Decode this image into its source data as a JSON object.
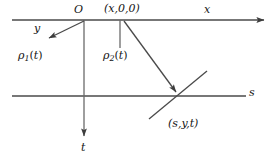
{
  "figure": {
    "type": "geometry-diagram",
    "background_color": "#ffffff",
    "stroke_color": "#4a4a4a",
    "text_color": "#151515",
    "width": 275,
    "height": 160
  },
  "labels": {
    "x_axis": "x",
    "s_axis": "s",
    "t_axis": "t",
    "y_axis": "y",
    "origin": "O",
    "rho1": "ρ",
    "rho1_sub": "1",
    "rho1_arg": "(t)",
    "rho2": "ρ",
    "rho2_sub": "2",
    "rho2_arg": "(t)",
    "point_top": "(x,0,0)",
    "point_bottom": "(s,y,t)"
  },
  "geometry": {
    "top_line": {
      "x1": 12,
      "y1": 20,
      "x2": 268,
      "y2": 20,
      "arrow": "right"
    },
    "bottom_line": {
      "x1": 12,
      "y1": 96,
      "x2": 246,
      "y2": 96,
      "arrow": "none"
    },
    "t_axis_line": {
      "x1": 84,
      "y1": 20,
      "x2": 84,
      "y2": 140,
      "arrow": "down"
    },
    "y_axis_arrow": {
      "x1": 84,
      "y1": 21,
      "x2": 46,
      "y2": 40,
      "arrow": "end"
    },
    "rho2_tick": {
      "x1": 120,
      "y1": 20,
      "x2": 120,
      "y2": 48,
      "arrow": "none"
    },
    "ray_to_point": {
      "x1": 124,
      "y1": 21,
      "x2": 176,
      "y2": 96,
      "arrow": "end"
    },
    "cross_line": {
      "x1": 149,
      "y1": 119,
      "x2": 207,
      "y2": 71,
      "arrow": "none"
    },
    "intersection": {
      "x": 176,
      "y": 96
    }
  }
}
